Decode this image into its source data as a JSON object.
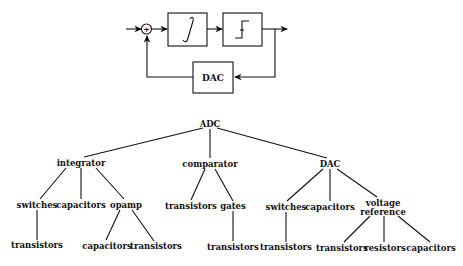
{
  "block_diagram": {
    "summing_junction_symbol": "+",
    "blocks": [
      {
        "id": "integrator",
        "icon": "integral-sign-icon",
        "glyph": "∫"
      },
      {
        "id": "comparator",
        "icon": "step-function-icon"
      },
      {
        "id": "dac",
        "label": "DAC"
      }
    ]
  },
  "tree": {
    "root": "ADC",
    "level1": {
      "integrator": "integrator",
      "comparator": "comparator",
      "dac": "DAC"
    },
    "level2": {
      "int_switches": "switches",
      "int_capacitors": "capacitors",
      "int_opamp": "opamp",
      "cmp_transistors": "transistors",
      "cmp_gates": "gates",
      "dac_switches": "switches",
      "dac_capacitors": "capacitors",
      "dac_vref_line1": "voltage",
      "dac_vref_line2": "reference"
    },
    "level3": {
      "int_sw_transistors": "transistors",
      "opamp_capacitors": "capacitors",
      "opamp_transistors": "transistors",
      "gates_transistors": "transistors",
      "dac_sw_transistors": "transistors",
      "vref_transistors": "transistors",
      "vref_resistors": "resistors",
      "vref_capacitors": "capacitors"
    }
  }
}
